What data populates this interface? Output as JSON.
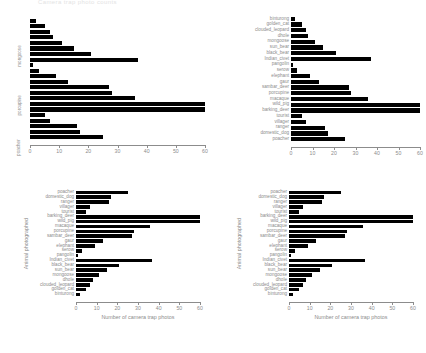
{
  "figure": {
    "top_caption": "Camera trap photo counts",
    "background": "#ffffff",
    "bar_color": "#000000",
    "axis_color": "#8c8c8c"
  },
  "chart_data": [
    {
      "id": "panel-top-left",
      "type": "bar",
      "orientation": "horizontal",
      "title": "",
      "xlabel": "",
      "ylabel": "",
      "xlim": [
        0,
        60
      ],
      "xticks": [
        0,
        10,
        20,
        30,
        40,
        50,
        60
      ],
      "grid": false,
      "legend": "none",
      "label_mode": "sparse",
      "visible_ylabels": [
        "mongoose",
        "porcupine",
        "poacher"
      ],
      "categories": [
        "binturong",
        "golden_cat",
        "clouded_leopard",
        "dhole",
        "mongoose",
        "sun_bear",
        "black_bear",
        "Indian_civet",
        "pangolin",
        "serow",
        "elephant",
        "gaur",
        "sambar_deer",
        "porcupine",
        "macaque",
        "wild_pig",
        "barking_deer",
        "tourist",
        "villager",
        "ranger",
        "domestic_dog",
        "poacher"
      ],
      "values": [
        2,
        5,
        7,
        8,
        11,
        15,
        21,
        37,
        1,
        3,
        9,
        13,
        27,
        28,
        36,
        60,
        60,
        5,
        7,
        16,
        17,
        25
      ]
    },
    {
      "id": "panel-top-right",
      "type": "bar",
      "orientation": "horizontal",
      "title": "",
      "xlabel": "",
      "ylabel": "",
      "xlim": [
        0,
        60
      ],
      "xticks": [
        0,
        10,
        20,
        30,
        40,
        50,
        60
      ],
      "grid": false,
      "legend": "none",
      "label_mode": "all",
      "categories": [
        "binturong",
        "golden_cat",
        "clouded_leopard",
        "dhole",
        "mongoose",
        "sun_bear",
        "black_bear",
        "Indian_civet",
        "pangolin",
        "serow",
        "elephant",
        "gaur",
        "sambar_deer",
        "porcupine",
        "macaque",
        "wild_pig",
        "barking_deer",
        "tourist",
        "villager",
        "ranger",
        "domestic_dog",
        "poacher"
      ],
      "values": [
        2,
        5,
        7,
        8,
        11,
        15,
        21,
        37,
        1,
        3,
        9,
        13,
        27,
        28,
        36,
        60,
        60,
        5,
        7,
        16,
        17,
        25
      ]
    },
    {
      "id": "panel-bottom-left",
      "type": "bar",
      "orientation": "horizontal",
      "title": "",
      "xlabel": "Number of camera trap photos",
      "ylabel": "Animal photographed",
      "xlim": [
        0,
        60
      ],
      "xticks": [
        0,
        10,
        20,
        30,
        40,
        50,
        60
      ],
      "grid": false,
      "legend": "none",
      "label_mode": "all",
      "categories": [
        "poacher",
        "domestic_dog",
        "ranger",
        "villager",
        "tourist",
        "barking_deer",
        "wild_pig",
        "macaque",
        "porcupine",
        "sambar_deer",
        "gaur",
        "elephant",
        "serow",
        "pangolin",
        "Indian_civet",
        "black_bear",
        "sun_bear",
        "mongoose",
        "dhole",
        "clouded_leopard",
        "golden_cat",
        "binturong"
      ],
      "values": [
        25,
        17,
        16,
        7,
        5,
        60,
        60,
        36,
        28,
        27,
        13,
        9,
        3,
        1,
        37,
        21,
        15,
        11,
        8,
        7,
        5,
        2
      ]
    },
    {
      "id": "panel-bottom-right",
      "type": "bar",
      "orientation": "horizontal",
      "title": "",
      "xlabel": "Number of camera trap photos",
      "ylabel": "Animal photographed",
      "xlim": [
        0,
        60
      ],
      "xticks": [
        0,
        10,
        20,
        30,
        40,
        50,
        60
      ],
      "grid": false,
      "legend": "none",
      "label_mode": "all",
      "categories": [
        "poacher",
        "domestic_dog",
        "ranger",
        "villager",
        "tourist",
        "barking_deer",
        "wild_pig",
        "macaque",
        "porcupine",
        "sambar_deer",
        "gaur",
        "elephant",
        "serow",
        "pangolin",
        "Indian_civet",
        "black_bear",
        "sun_bear",
        "mongoose",
        "dhole",
        "clouded_leopard",
        "golden_cat",
        "binturong"
      ],
      "values": [
        25,
        17,
        16,
        7,
        5,
        60,
        60,
        36,
        28,
        27,
        13,
        9,
        3,
        1,
        37,
        21,
        15,
        11,
        8,
        7,
        5,
        2
      ]
    }
  ]
}
